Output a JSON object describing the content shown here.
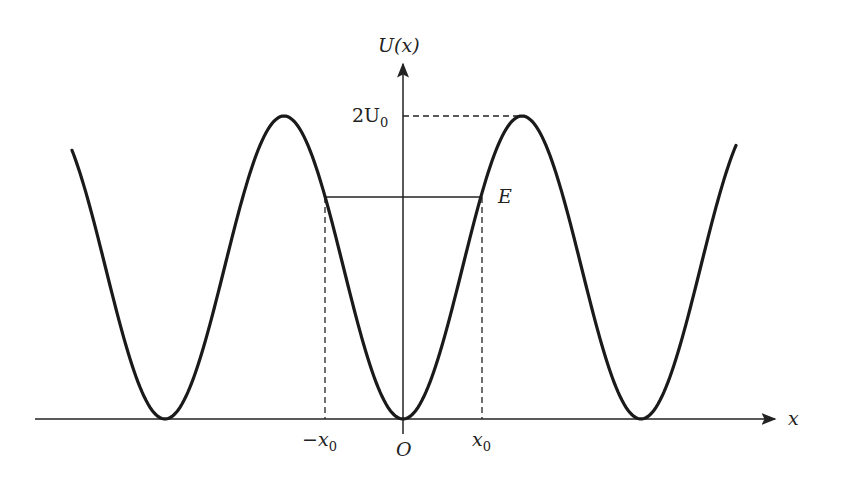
{
  "diagram": {
    "y_axis_label": "U(x)",
    "x_axis_label": "x",
    "origin_label": "O",
    "peak_label": {
      "main": "2U",
      "sub": "0"
    },
    "energy_label": "E",
    "neg_turning_point": {
      "main": "−x",
      "sub": "0"
    },
    "pos_turning_point": {
      "main": "x",
      "sub": "0"
    },
    "curve_color": "#1a1a1a",
    "axis_color": "#222222"
  }
}
